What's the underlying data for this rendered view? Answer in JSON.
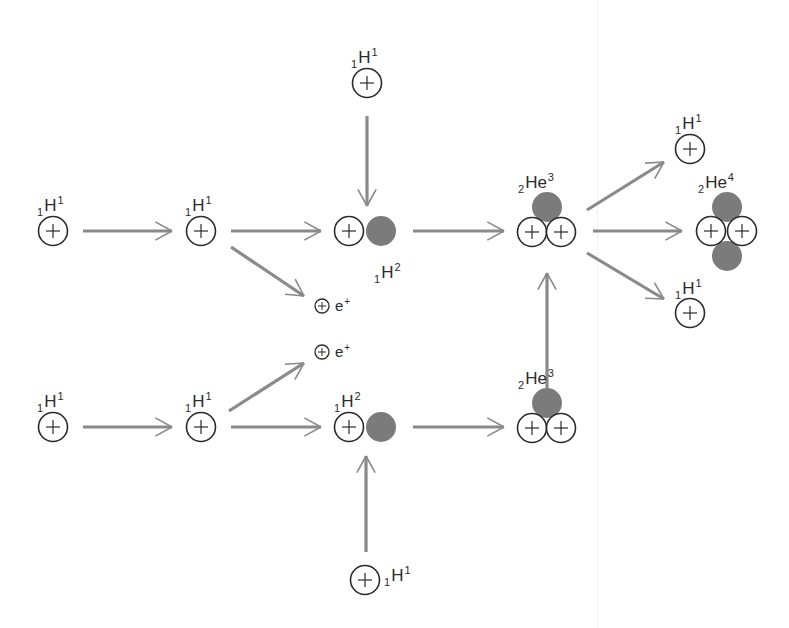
{
  "diagram": {
    "colors": {
      "arrow": "#8a8a8a",
      "outline": "#2b2b2b",
      "neutron": "#7b7b7b",
      "text": "#2b2b2b",
      "background": "#ffffff"
    },
    "nuclei": [
      {
        "id": "h1-top-left-a",
        "element": "H",
        "z": "1",
        "a": "1",
        "protons": [
          [
            53,
            231
          ]
        ],
        "neutrons": [],
        "label_pos": [
          37,
          197
        ]
      },
      {
        "id": "h1-top-left-b",
        "element": "H",
        "z": "1",
        "a": "1",
        "protons": [
          [
            201,
            231
          ]
        ],
        "neutrons": [],
        "label_pos": [
          185,
          197
        ]
      },
      {
        "id": "h1-top-incoming",
        "element": "H",
        "z": "1",
        "a": "1",
        "protons": [
          [
            367,
            83
          ]
        ],
        "neutrons": [],
        "label_pos": [
          351,
          49
        ]
      },
      {
        "id": "h2-top",
        "element": "H",
        "z": "1",
        "a": "2",
        "protons": [
          [
            349,
            231
          ]
        ],
        "neutrons": [
          [
            381,
            231
          ]
        ],
        "label_pos": [
          374,
          264
        ]
      },
      {
        "id": "he3-top",
        "element": "He",
        "z": "2",
        "a": "3",
        "protons": [
          [
            532,
            232
          ],
          [
            561,
            232
          ]
        ],
        "neutrons": [
          [
            547,
            207
          ]
        ],
        "label_pos": [
          518,
          174
        ]
      },
      {
        "id": "h1-out-top",
        "element": "H",
        "z": "1",
        "a": "1",
        "protons": [
          [
            690,
            149
          ]
        ],
        "neutrons": [],
        "label_pos": [
          675,
          115
        ]
      },
      {
        "id": "he4-out",
        "element": "He",
        "z": "2",
        "a": "4",
        "protons": [
          [
            711,
            231
          ],
          [
            742,
            231
          ]
        ],
        "neutrons": [
          [
            727,
            207
          ],
          [
            727,
            256
          ]
        ],
        "label_pos": [
          698,
          174
        ]
      },
      {
        "id": "h1-out-bottom",
        "element": "H",
        "z": "1",
        "a": "1",
        "protons": [
          [
            690,
            313
          ]
        ],
        "neutrons": [],
        "label_pos": [
          675,
          280
        ]
      },
      {
        "id": "h1-bottom-left-a",
        "element": "H",
        "z": "1",
        "a": "1",
        "protons": [
          [
            53,
            427
          ]
        ],
        "neutrons": [],
        "label_pos": [
          37,
          393
        ]
      },
      {
        "id": "h1-bottom-left-b",
        "element": "H",
        "z": "1",
        "a": "1",
        "protons": [
          [
            201,
            427
          ]
        ],
        "neutrons": [],
        "label_pos": [
          185,
          393
        ]
      },
      {
        "id": "h2-bottom",
        "element": "H",
        "z": "1",
        "a": "2",
        "protons": [
          [
            349,
            427
          ]
        ],
        "neutrons": [
          [
            381,
            427
          ]
        ],
        "label_pos": [
          334,
          393
        ]
      },
      {
        "id": "he3-bottom",
        "element": "He",
        "z": "2",
        "a": "3",
        "protons": [
          [
            532,
            428
          ],
          [
            561,
            428
          ]
        ],
        "neutrons": [
          [
            547,
            403
          ]
        ],
        "label_pos": [
          518,
          370
        ]
      },
      {
        "id": "h1-bottom-incoming",
        "element": "H",
        "z": "1",
        "a": "1",
        "protons": [
          [
            365,
            580
          ]
        ],
        "neutrons": [],
        "label_pos": [
          384,
          567
        ]
      }
    ],
    "positrons": [
      {
        "id": "positron-top",
        "symbol": "e",
        "charge": "+",
        "pos": [
          322,
          306
        ]
      },
      {
        "id": "positron-bottom",
        "symbol": "e",
        "charge": "+",
        "pos": [
          322,
          352
        ]
      }
    ],
    "arrows": [
      {
        "id": "arrow-h1-to-h1-top",
        "from": [
          83,
          231
        ],
        "to": [
          172,
          231
        ]
      },
      {
        "id": "arrow-h1-to-h2-top",
        "from": [
          231,
          231
        ],
        "to": [
          321,
          231
        ]
      },
      {
        "id": "arrow-to-positron-top",
        "from": [
          231,
          247
        ],
        "to": [
          304,
          296
        ]
      },
      {
        "id": "arrow-incoming-top",
        "from": [
          367,
          116
        ],
        "to": [
          367,
          206
        ]
      },
      {
        "id": "arrow-h2-to-he3-top",
        "from": [
          413,
          231
        ],
        "to": [
          504,
          231
        ]
      },
      {
        "id": "arrow-he3-to-h1-out-top",
        "from": [
          587,
          210
        ],
        "to": [
          664,
          162
        ]
      },
      {
        "id": "arrow-he3-to-he4",
        "from": [
          593,
          231
        ],
        "to": [
          682,
          231
        ]
      },
      {
        "id": "arrow-he3-to-h1-out-bottom",
        "from": [
          587,
          253
        ],
        "to": [
          664,
          299
        ]
      },
      {
        "id": "arrow-h1-to-h1-bottom",
        "from": [
          83,
          427
        ],
        "to": [
          172,
          427
        ]
      },
      {
        "id": "arrow-to-positron-bottom",
        "from": [
          229,
          411
        ],
        "to": [
          304,
          363
        ]
      },
      {
        "id": "arrow-h1-to-h2-bottom",
        "from": [
          231,
          427
        ],
        "to": [
          321,
          427
        ]
      },
      {
        "id": "arrow-incoming-bottom",
        "from": [
          366,
          552
        ],
        "to": [
          366,
          456
        ]
      },
      {
        "id": "arrow-h2-to-he3-bottom",
        "from": [
          413,
          427
        ],
        "to": [
          504,
          427
        ]
      },
      {
        "id": "arrow-he3-bottom-to-he3-top",
        "from": [
          547,
          388
        ],
        "to": [
          547,
          273
        ]
      }
    ]
  }
}
